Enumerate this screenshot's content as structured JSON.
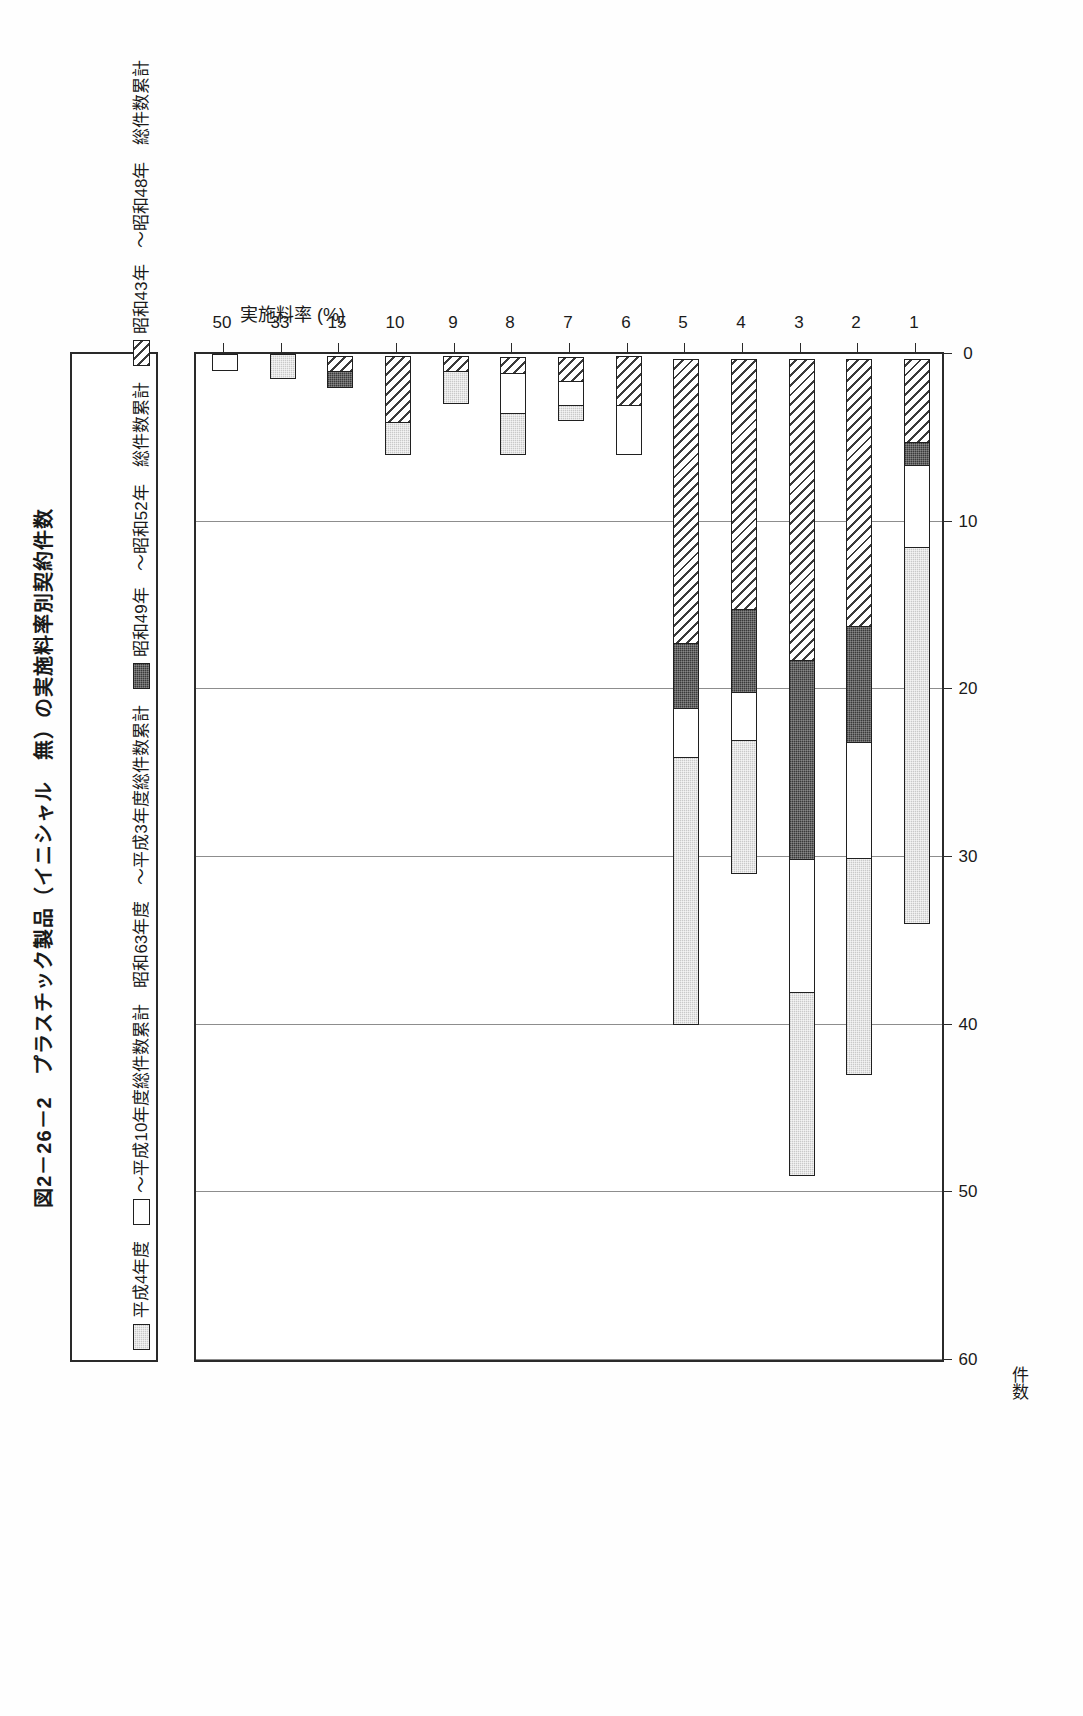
{
  "figure": {
    "title": "図2－26－2　プラスチック製品（イニシャル　無）の実施料率別契約件数",
    "value_axis_label": "件数",
    "category_axis_label": "実施料率 (%)"
  },
  "legend": {
    "items": [
      {
        "label": "平成4年度",
        "swatch": "gray-dotted-swatch",
        "color": "#c9c9c9"
      },
      {
        "label": "～平成10年度総件数累計",
        "swatch": "white-swatch",
        "color": "#ffffff"
      },
      {
        "label": "昭和63年度",
        "swatch": "white-swatch-2",
        "color": "#ffffff"
      },
      {
        "label": "～平成3年度総件数累計",
        "swatch": "dark-swatch",
        "color": "#3a3a3a"
      },
      {
        "label": "昭和49年",
        "swatch": "dark-swatch-2",
        "color": "#3a3a3a"
      },
      {
        "label": "～昭和52年　総件数累計",
        "swatch": "hatch-swatch",
        "color": "#3b3b3b"
      },
      {
        "label": "昭和43年",
        "swatch": "hatch-swatch-2",
        "color": "#3b3b3b"
      },
      {
        "label": "～昭和48年　総件数累計",
        "swatch": "hatch-swatch-3",
        "color": "#3b3b3b"
      }
    ],
    "display_items": [
      {
        "label": "平成4年度",
        "fill": "gray"
      },
      {
        "label": "～平成10年度総件数累計",
        "fill": "white"
      },
      {
        "label": "昭和63年度",
        "fill": "none"
      },
      {
        "label": "～平成3年度総件数累計",
        "fill": "none"
      },
      {
        "label": "昭和49年",
        "fill": "dark"
      },
      {
        "label": "～昭和52年　総件数累計",
        "fill": "none"
      },
      {
        "label": "昭和43年",
        "fill": "hatch"
      },
      {
        "label": "～昭和48年　総件数累計",
        "fill": "none"
      }
    ]
  },
  "chart_data": {
    "type": "bar",
    "orientation": "vertical-stacked",
    "title": "図2－26－2　プラスチック製品（イニシャル　無）の実施料率別契約件数",
    "xlabel": "実施料率 (%)",
    "ylabel": "件数",
    "ylim": [
      0,
      60
    ],
    "yticks": [
      0,
      10,
      20,
      30,
      40,
      50,
      60
    ],
    "grid": true,
    "legend_position": "top",
    "categories": [
      "1",
      "2",
      "3",
      "4",
      "5",
      "6",
      "7",
      "8",
      "9",
      "10",
      "15",
      "33",
      "50"
    ],
    "series": [
      {
        "name": "平成4年度～平成10年度総件数累計",
        "fill": "gray",
        "values": [
          22.5,
          13,
          11,
          8,
          16,
          0,
          1,
          2.5,
          2,
          2,
          0,
          1.5,
          0
        ]
      },
      {
        "name": "昭和63年度～平成3年度総件数累計",
        "fill": "white",
        "values": [
          5,
          7,
          8,
          3,
          3,
          3,
          1.5,
          2.5,
          0,
          0,
          0,
          0,
          1
        ]
      },
      {
        "name": "昭和49年～昭和52年　総件数累計",
        "fill": "dark",
        "values": [
          1.5,
          7,
          12,
          5,
          4,
          0,
          0,
          0,
          0,
          0,
          1,
          0,
          0
        ]
      },
      {
        "name": "昭和43年～昭和48年　総件数累計",
        "fill": "hatch",
        "values": [
          5,
          16,
          18,
          15,
          17,
          3,
          1.5,
          1,
          1,
          4,
          1,
          0,
          0
        ]
      }
    ],
    "totals": [
      34,
      43,
      49,
      31,
      40,
      6,
      4,
      6,
      3,
      6,
      2,
      1.5,
      1
    ]
  },
  "axis": {
    "value_ticks": [
      "60",
      "50",
      "40",
      "30",
      "20",
      "10",
      "0"
    ],
    "category_ticks": [
      "1",
      "2",
      "3",
      "4",
      "5",
      "6",
      "7",
      "8",
      "9",
      "10",
      "15",
      "33",
      "50"
    ]
  }
}
